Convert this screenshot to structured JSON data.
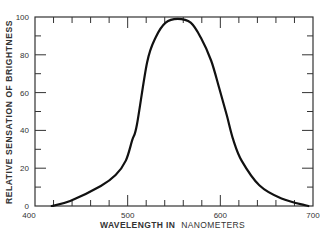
{
  "chart_data": {
    "type": "line",
    "title": "",
    "xlabel_bold": "WAVELENGTH IN",
    "xlabel_light": "NANOMETERS",
    "ylabel": "RELATIVE SENSATION OF BRIGHTNESS",
    "xlim": [
      400,
      700
    ],
    "ylim": [
      0,
      100
    ],
    "x_ticks": [
      400,
      500,
      600,
      700
    ],
    "y_ticks": [
      0,
      20,
      40,
      60,
      80,
      100
    ],
    "x_minor_step": 20,
    "y_minor_step": 10,
    "grid": false,
    "legend": null,
    "series": [
      {
        "name": "Relative brightness sensitivity",
        "x": [
          418,
          438,
          471,
          487,
          498,
          505,
          510,
          521,
          530,
          541,
          554,
          568,
          579,
          590,
          599,
          607,
          614,
          623,
          642,
          666,
          695
        ],
        "y": [
          0,
          2.6,
          10.6,
          16.4,
          24,
          35,
          43,
          76,
          89,
          97,
          99,
          97,
          89,
          77,
          62,
          48,
          35,
          24,
          11,
          4,
          0
        ]
      }
    ]
  },
  "colors": {
    "line": "#111111",
    "axis": "#333333",
    "text": "#333333"
  }
}
